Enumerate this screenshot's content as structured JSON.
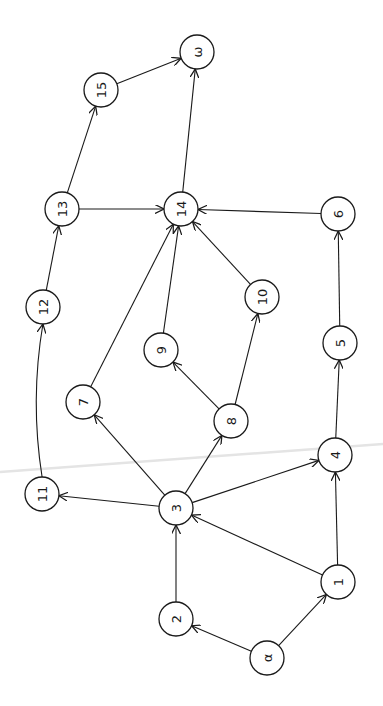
{
  "diagram": {
    "type": "directed-network-graph",
    "orientation": "rotated-90-ccw",
    "node_radius": 17,
    "stroke_color": "#1a1a1a",
    "background": "#ffffff",
    "nodes": [
      {
        "id": "omega",
        "label": "ω",
        "x": 197,
        "y": 52
      },
      {
        "id": "15",
        "label": "15",
        "x": 101,
        "y": 90
      },
      {
        "id": "13",
        "label": "13",
        "x": 62,
        "y": 209
      },
      {
        "id": "14",
        "label": "14",
        "x": 181,
        "y": 209
      },
      {
        "id": "6",
        "label": "6",
        "x": 338,
        "y": 214
      },
      {
        "id": "12",
        "label": "12",
        "x": 43,
        "y": 307
      },
      {
        "id": "10",
        "label": "10",
        "x": 262,
        "y": 297
      },
      {
        "id": "9",
        "label": "9",
        "x": 161,
        "y": 350
      },
      {
        "id": "5",
        "label": "5",
        "x": 340,
        "y": 343
      },
      {
        "id": "7",
        "label": "7",
        "x": 83,
        "y": 402
      },
      {
        "id": "8",
        "label": "8",
        "x": 231,
        "y": 421
      },
      {
        "id": "4",
        "label": "4",
        "x": 335,
        "y": 455
      },
      {
        "id": "11",
        "label": "11",
        "x": 42,
        "y": 494
      },
      {
        "id": "3",
        "label": "3",
        "x": 176,
        "y": 508
      },
      {
        "id": "1",
        "label": "1",
        "x": 338,
        "y": 582
      },
      {
        "id": "2",
        "label": "2",
        "x": 176,
        "y": 619
      },
      {
        "id": "alpha",
        "label": "α",
        "x": 267,
        "y": 658
      }
    ],
    "edges": [
      {
        "from": "alpha",
        "to": "2"
      },
      {
        "from": "alpha",
        "to": "1"
      },
      {
        "from": "2",
        "to": "3"
      },
      {
        "from": "1",
        "to": "3"
      },
      {
        "from": "1",
        "to": "4"
      },
      {
        "from": "3",
        "to": "4"
      },
      {
        "from": "3",
        "to": "11"
      },
      {
        "from": "3",
        "to": "7"
      },
      {
        "from": "3",
        "to": "8"
      },
      {
        "from": "4",
        "to": "5"
      },
      {
        "from": "5",
        "to": "6"
      },
      {
        "from": "8",
        "to": "9"
      },
      {
        "from": "8",
        "to": "10"
      },
      {
        "from": "7",
        "to": "14"
      },
      {
        "from": "9",
        "to": "14"
      },
      {
        "from": "10",
        "to": "14"
      },
      {
        "from": "6",
        "to": "14"
      },
      {
        "from": "11",
        "to": "12",
        "curved": true
      },
      {
        "from": "12",
        "to": "13"
      },
      {
        "from": "13",
        "to": "14"
      },
      {
        "from": "13",
        "to": "15"
      },
      {
        "from": "14",
        "to": "omega"
      },
      {
        "from": "15",
        "to": "omega"
      }
    ]
  }
}
